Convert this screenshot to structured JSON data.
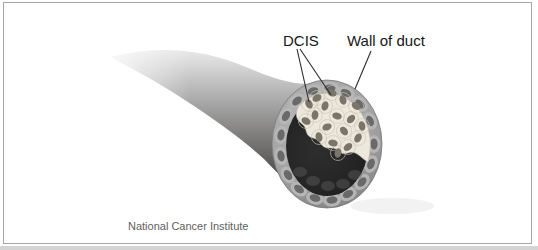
{
  "labels": {
    "dcis": "DCIS",
    "wall_of_duct": "Wall of duct"
  },
  "credit": "National Cancer Institute",
  "palette": {
    "label_text": "#161616",
    "credit_text": "#5f5f5f",
    "leader_line": "#2b2b2b",
    "frame_border": "#a6a6a6",
    "duct_highlight": "#f2f2f2",
    "duct_shadow": "#454442",
    "wall_ring_light": "#b3b3b3",
    "wall_ring": "#9a9a9a",
    "wall_cell_body": "#b7b7b7",
    "wall_nucleus": "#696969",
    "lumen": "#242424",
    "dcis_cell": "#ece8dc",
    "dcis_membrane": "#c9c4b4",
    "dcis_nucleus": "#7b7468"
  }
}
